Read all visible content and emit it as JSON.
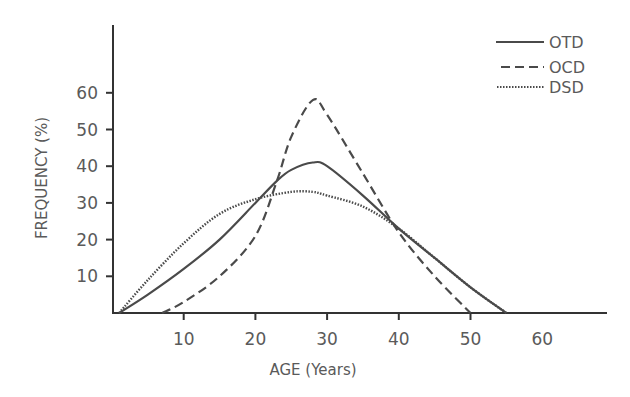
{
  "chart_data": {
    "type": "line",
    "title": "",
    "xlabel": "AGE (Years)",
    "ylabel": "FREQUENCY (%)",
    "xlim": [
      0,
      68
    ],
    "ylim": [
      0,
      80
    ],
    "xticks": [
      10,
      20,
      30,
      40,
      50,
      60
    ],
    "yticks": [
      10,
      20,
      30,
      40,
      50,
      60
    ],
    "grid": false,
    "legend_position": "top-right",
    "series": [
      {
        "name": "OTD",
        "style": "solid",
        "x": [
          1,
          5,
          10,
          15,
          20,
          23,
          25,
          28,
          30,
          35,
          40,
          45,
          50,
          55
        ],
        "y": [
          0,
          5,
          12,
          20,
          30,
          36,
          39,
          41,
          40,
          32,
          23,
          15,
          7,
          0
        ]
      },
      {
        "name": "OCD",
        "style": "dashed",
        "x": [
          7,
          10,
          15,
          20,
          23,
          25,
          28,
          30,
          35,
          40,
          45,
          50
        ],
        "y": [
          0,
          3,
          10,
          21,
          36,
          48,
          58,
          54,
          38,
          22,
          10,
          0
        ]
      },
      {
        "name": "DSD",
        "style": "dotted",
        "x": [
          1,
          5,
          10,
          15,
          20,
          25,
          28,
          30,
          35,
          40,
          45,
          50,
          55
        ],
        "y": [
          0,
          9,
          19,
          27,
          31,
          33,
          33,
          32,
          29,
          23,
          15,
          7,
          0
        ]
      }
    ]
  },
  "axes": {
    "x_title": "AGE (Years)",
    "y_title": "FREQUENCY (%)",
    "x_tick_labels": [
      "10",
      "20",
      "30",
      "40",
      "50",
      "60"
    ],
    "y_tick_labels": [
      "10",
      "20",
      "30",
      "40",
      "50",
      "60"
    ]
  },
  "legend": {
    "items": [
      {
        "label": "OTD",
        "style": "solid"
      },
      {
        "label": "OCD",
        "style": "dashed"
      },
      {
        "label": "DSD",
        "style": "dotted"
      }
    ]
  },
  "colors": {
    "line": "#4a4a4a",
    "axis": "#333333",
    "text": "#5a5a5a"
  }
}
